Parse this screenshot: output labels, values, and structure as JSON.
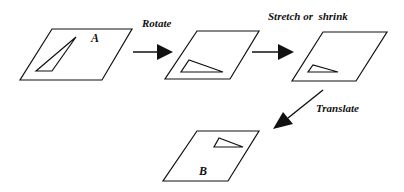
{
  "diagram": {
    "panels": [
      {
        "id": "A",
        "label": "A"
      },
      {
        "id": "rotated",
        "label": ""
      },
      {
        "id": "scaled",
        "label": ""
      },
      {
        "id": "B",
        "label": "B"
      }
    ],
    "steps": [
      {
        "label": "Rotate"
      },
      {
        "label": "Stretch or  shrink"
      },
      {
        "label": "Translate"
      }
    ],
    "colors": {
      "stroke": "#111111",
      "background": "#ffffff"
    }
  }
}
